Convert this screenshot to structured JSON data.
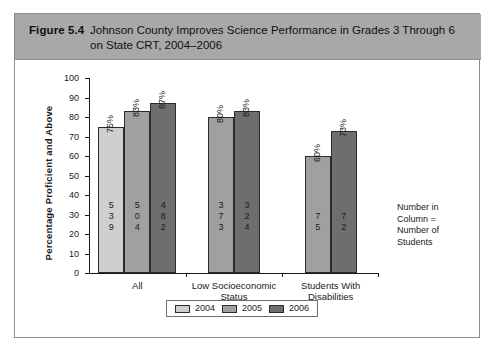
{
  "figure": {
    "number": "Figure 5.4",
    "title": "Johnson County Improves Science Performance in Grades 3 Through 6 on State CRT, 2004–2006"
  },
  "note": {
    "line1": "Number in",
    "line2": "Column =",
    "line3": "Number of",
    "line4": "Students"
  },
  "colors": {
    "header_band": "#a8a8a8",
    "series_2004": "#cfcfcf",
    "series_2005": "#a0a0a0",
    "series_2006": "#6e6e6e",
    "axis": "#1a1a1a",
    "frame": "#8c8c8c"
  },
  "chart_data": {
    "type": "bar",
    "title": "Johnson County Improves Science Performance in Grades 3 Through 6 on State CRT, 2004–2006",
    "xlabel": "",
    "ylabel": "Percentage Proficient and Above",
    "ylim": [
      0,
      100
    ],
    "ytick_labels": [
      "0",
      "10",
      "20",
      "30",
      "40",
      "50",
      "60",
      "70",
      "80",
      "90",
      "100"
    ],
    "ytick_values": [
      0,
      10,
      20,
      30,
      40,
      50,
      60,
      70,
      80,
      90,
      100
    ],
    "grid": false,
    "legend_position": "bottom",
    "categories": [
      "All",
      "Low Socioeconomic Status",
      "Students With Disabilities"
    ],
    "category_lines": [
      [
        "All"
      ],
      [
        "Low Socioeconomic",
        "Status"
      ],
      [
        "Students With",
        "Disabilities"
      ]
    ],
    "series": [
      {
        "name": "2004",
        "color": "#cfcfcf",
        "values": [
          75,
          null,
          null
        ],
        "value_labels": [
          "75%",
          null,
          null
        ],
        "counts": [
          539,
          null,
          null
        ],
        "count_digits": [
          [
            "5",
            "3",
            "9"
          ],
          null,
          null
        ]
      },
      {
        "name": "2005",
        "color": "#a0a0a0",
        "values": [
          83,
          80,
          60
        ],
        "value_labels": [
          "83%",
          "80%",
          "60%"
        ],
        "counts": [
          504,
          373,
          75
        ],
        "count_digits": [
          [
            "5",
            "0",
            "4"
          ],
          [
            "3",
            "7",
            "3"
          ],
          [
            "7",
            "5"
          ]
        ]
      },
      {
        "name": "2006",
        "color": "#6e6e6e",
        "values": [
          87,
          83,
          73
        ],
        "value_labels": [
          "87%",
          "83%",
          "73%"
        ],
        "counts": [
          482,
          324,
          72
        ],
        "count_digits": [
          [
            "4",
            "8",
            "2"
          ],
          [
            "3",
            "2",
            "4"
          ],
          [
            "7",
            "2"
          ]
        ]
      }
    ],
    "legend": [
      "2004",
      "2005",
      "2006"
    ]
  }
}
